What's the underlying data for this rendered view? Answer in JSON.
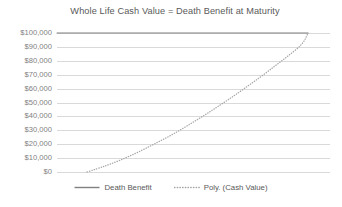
{
  "chart_data": {
    "type": "line",
    "title": "Whole Life Cash Value = Death Benefit at Maturity",
    "xlabel": "",
    "ylabel": "",
    "ylim": [
      0,
      100000
    ],
    "xlim": [
      0,
      100
    ],
    "grid": true,
    "x_axis_visible": false,
    "legend_position": "bottom",
    "y_ticks": [
      "$100,000",
      "$90,000",
      "$80,000",
      "$70,000",
      "$60,000",
      "$50,000",
      "$40,000",
      "$30,000",
      "$20,000",
      "$10,000",
      "$0"
    ],
    "y_tick_values": [
      100000,
      90000,
      80000,
      70000,
      60000,
      50000,
      40000,
      30000,
      20000,
      10000,
      0
    ],
    "x": [
      0,
      5,
      10,
      11,
      15,
      20,
      25,
      30,
      35,
      40,
      45,
      50,
      55,
      60,
      65,
      70,
      75,
      80,
      85,
      90,
      92
    ],
    "series": [
      {
        "name": "Death Benefit",
        "style": "solid",
        "color": "#808080",
        "values": [
          100000,
          100000,
          100000,
          100000,
          100000,
          100000,
          100000,
          100000,
          100000,
          100000,
          100000,
          100000,
          100000,
          100000,
          100000,
          100000,
          100000,
          100000,
          100000,
          100000,
          100000
        ]
      },
      {
        "name": "Poly. (Cash Value)",
        "style": "dotted",
        "color": "#a6a6a6",
        "values": [
          null,
          null,
          null,
          0,
          2500,
          6000,
          10000,
          14500,
          19500,
          24500,
          30000,
          36000,
          42000,
          48500,
          55000,
          62000,
          69000,
          76500,
          84000,
          92000,
          100000
        ]
      }
    ],
    "legend": [
      {
        "label": "Death Benefit",
        "style": "solid",
        "color": "#808080"
      },
      {
        "label": "Poly. (Cash Value)",
        "style": "dotted",
        "color": "#a6a6a6"
      }
    ]
  }
}
